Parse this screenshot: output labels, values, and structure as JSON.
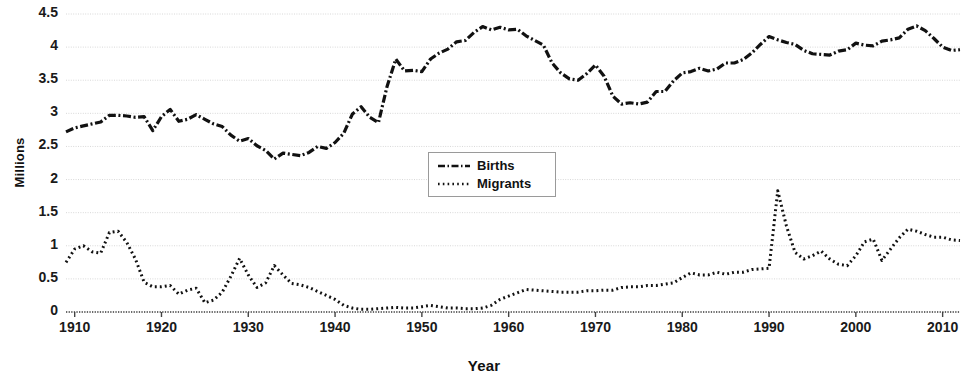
{
  "chart_data": {
    "type": "line",
    "title": "",
    "xlabel": "Year",
    "ylabel": "Millions",
    "xlim": [
      1909,
      2012
    ],
    "ylim": [
      0,
      4.5
    ],
    "grid": true,
    "legend_position": "center",
    "x_ticks": [
      "1910",
      "1920",
      "1930",
      "1940",
      "1950",
      "1960",
      "1970",
      "1980",
      "1990",
      "2000",
      "2010"
    ],
    "y_ticks": [
      "0",
      "0.5",
      "1",
      "1.5",
      "2",
      "2.5",
      "3",
      "3.5",
      "4",
      "4.5"
    ],
    "x": [
      1909,
      1910,
      1911,
      1912,
      1913,
      1914,
      1915,
      1916,
      1917,
      1918,
      1919,
      1920,
      1921,
      1922,
      1923,
      1924,
      1925,
      1926,
      1927,
      1928,
      1929,
      1930,
      1931,
      1932,
      1933,
      1934,
      1935,
      1936,
      1937,
      1938,
      1939,
      1940,
      1941,
      1942,
      1943,
      1944,
      1945,
      1946,
      1947,
      1948,
      1949,
      1950,
      1951,
      1952,
      1953,
      1954,
      1955,
      1956,
      1957,
      1958,
      1959,
      1960,
      1961,
      1962,
      1963,
      1964,
      1965,
      1966,
      1967,
      1968,
      1969,
      1970,
      1971,
      1972,
      1973,
      1974,
      1975,
      1976,
      1977,
      1978,
      1979,
      1980,
      1981,
      1982,
      1983,
      1984,
      1985,
      1986,
      1987,
      1988,
      1989,
      1990,
      1991,
      1992,
      1993,
      1994,
      1995,
      1996,
      1997,
      1998,
      1999,
      2000,
      2001,
      2002,
      2003,
      2004,
      2005,
      2006,
      2007,
      2008,
      2009,
      2010,
      2011,
      2012
    ],
    "series": [
      {
        "name": "Births",
        "style": "dash-dot",
        "color": "#111111",
        "values": [
          2.72,
          2.78,
          2.81,
          2.84,
          2.87,
          2.97,
          2.97,
          2.96,
          2.94,
          2.95,
          2.74,
          2.95,
          3.06,
          2.88,
          2.91,
          2.98,
          2.91,
          2.84,
          2.8,
          2.67,
          2.58,
          2.62,
          2.51,
          2.44,
          2.31,
          2.4,
          2.38,
          2.36,
          2.41,
          2.5,
          2.47,
          2.56,
          2.7,
          2.99,
          3.1,
          2.94,
          2.86,
          3.41,
          3.82,
          3.64,
          3.65,
          3.63,
          3.82,
          3.91,
          3.97,
          4.08,
          4.1,
          4.22,
          4.31,
          4.26,
          4.3,
          4.26,
          4.27,
          4.17,
          4.1,
          4.03,
          3.76,
          3.61,
          3.52,
          3.5,
          3.6,
          3.73,
          3.56,
          3.26,
          3.14,
          3.16,
          3.14,
          3.17,
          3.33,
          3.33,
          3.49,
          3.61,
          3.63,
          3.68,
          3.64,
          3.67,
          3.76,
          3.76,
          3.81,
          3.91,
          4.04,
          4.16,
          4.11,
          4.07,
          4.04,
          3.95,
          3.9,
          3.89,
          3.88,
          3.94,
          3.96,
          4.06,
          4.03,
          4.02,
          4.09,
          4.11,
          4.14,
          4.27,
          4.32,
          4.25,
          4.13,
          4.0,
          3.95,
          3.96
        ]
      },
      {
        "name": "Migrants",
        "style": "dotted",
        "color": "#111111",
        "values": [
          0.75,
          0.95,
          1.0,
          0.91,
          0.89,
          1.2,
          1.22,
          1.05,
          0.8,
          0.45,
          0.38,
          0.38,
          0.4,
          0.27,
          0.33,
          0.36,
          0.14,
          0.18,
          0.3,
          0.54,
          0.81,
          0.56,
          0.37,
          0.44,
          0.7,
          0.56,
          0.43,
          0.41,
          0.37,
          0.31,
          0.25,
          0.19,
          0.1,
          0.06,
          0.04,
          0.04,
          0.05,
          0.06,
          0.07,
          0.06,
          0.06,
          0.08,
          0.1,
          0.08,
          0.06,
          0.06,
          0.05,
          0.05,
          0.06,
          0.1,
          0.19,
          0.24,
          0.29,
          0.34,
          0.33,
          0.32,
          0.31,
          0.3,
          0.3,
          0.3,
          0.32,
          0.32,
          0.33,
          0.33,
          0.37,
          0.38,
          0.38,
          0.4,
          0.4,
          0.42,
          0.44,
          0.52,
          0.59,
          0.56,
          0.56,
          0.6,
          0.57,
          0.6,
          0.6,
          0.64,
          0.65,
          0.66,
          1.83,
          1.3,
          0.9,
          0.8,
          0.85,
          0.92,
          0.8,
          0.72,
          0.7,
          0.85,
          1.06,
          1.1,
          0.78,
          0.95,
          1.12,
          1.25,
          1.22,
          1.17,
          1.13,
          1.13,
          1.09,
          1.08
        ]
      }
    ]
  },
  "axes": {
    "x_title": "Year",
    "y_title": "Millions"
  },
  "legend": {
    "items": [
      {
        "label": "Births",
        "style": "dash-dot"
      },
      {
        "label": "Migrants",
        "style": "dotted"
      }
    ]
  },
  "colors": {
    "line": "#111111",
    "grid": "#d8d8d8",
    "axis": "#555555",
    "background": "#ffffff"
  }
}
